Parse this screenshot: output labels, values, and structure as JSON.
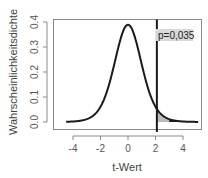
{
  "chart_data": {
    "type": "line",
    "title": "",
    "xlabel": "t-Wert",
    "ylabel": "Wahrscheinlichkeitsdichte",
    "xlim": [
      -4.6,
      5.3
    ],
    "ylim": [
      0.0,
      0.4
    ],
    "x_ticks": [
      -4,
      -2,
      0,
      2,
      4
    ],
    "x_tick_labels": [
      "-4",
      "-2",
      "0",
      "2",
      "4"
    ],
    "y_ticks": [
      0.0,
      0.1,
      0.2,
      0.3,
      0.4
    ],
    "y_tick_labels": [
      "0.0",
      "0.1",
      "0.2",
      "0.3",
      "0.4"
    ],
    "grid": false,
    "series": [
      {
        "name": "t-Verteilung",
        "x": [
          -4.5,
          -4,
          -3.5,
          -3,
          -2.5,
          -2,
          -1.5,
          -1,
          -0.5,
          0,
          0.5,
          1,
          1.5,
          2,
          2.5,
          3,
          3.5,
          4,
          4.5,
          5
        ],
        "values": [
          0.002,
          0.004,
          0.007,
          0.011,
          0.022,
          0.061,
          0.127,
          0.23,
          0.34,
          0.389,
          0.34,
          0.23,
          0.127,
          0.061,
          0.022,
          0.011,
          0.007,
          0.004,
          0.002,
          0.001
        ]
      }
    ],
    "critical_line": {
      "x": 2.1
    },
    "shaded_region": {
      "from": 2.1,
      "to": 5.0,
      "color": "#bdbdbd"
    },
    "tail_region": {
      "from": 3.0,
      "to": 5.0,
      "color": "#1a1a1a"
    },
    "annotations": [
      {
        "text": "p=0,035",
        "x": 2.1,
        "y": 0.35,
        "background": "#d9d9d9"
      }
    ]
  }
}
